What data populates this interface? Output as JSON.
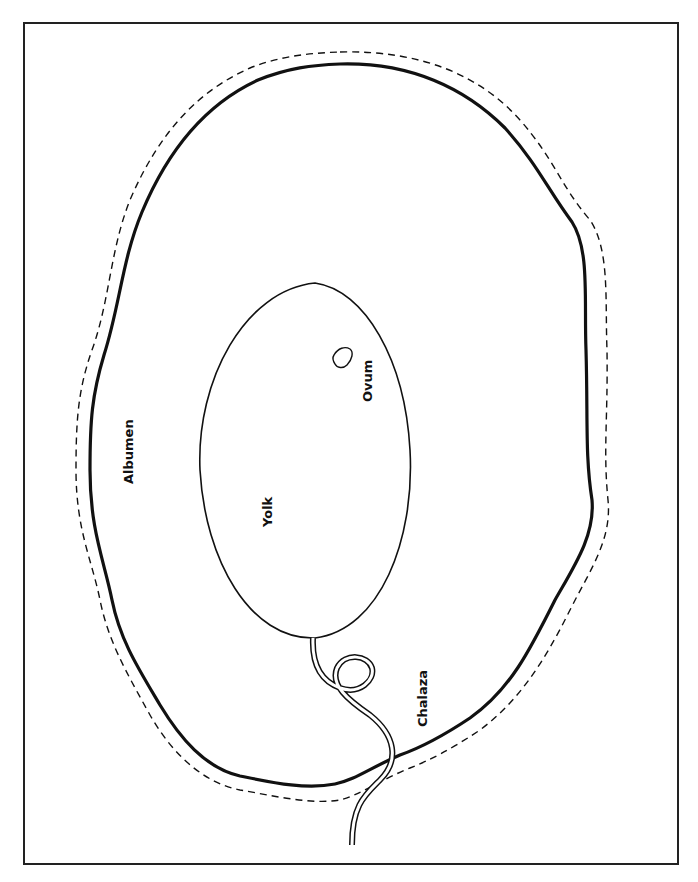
{
  "diagram": {
    "labels": {
      "albumen": "Albumen",
      "yolk": "Yolk",
      "ovum": "Ovum",
      "chalaza": "Chalaza"
    }
  },
  "colors": {
    "line": "#111111",
    "background": "#ffffff",
    "frame": "#222222"
  }
}
